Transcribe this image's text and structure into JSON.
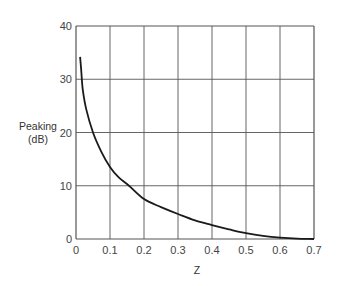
{
  "chart_data": {
    "type": "line",
    "title": "",
    "xlabel": "Z",
    "ylabel": "Peaking (dB)",
    "ylabel_lines": [
      "Peaking",
      "(dB)"
    ],
    "xlim": [
      0,
      0.7
    ],
    "ylim": [
      0,
      40
    ],
    "xticks": [
      "0",
      "0.1",
      "0.2",
      "0.3",
      "0.4",
      "0.5",
      "0.6",
      "0.7"
    ],
    "yticks": [
      "0",
      "10",
      "20",
      "30",
      "40"
    ],
    "grid": true,
    "legend": null,
    "series": [
      {
        "name": "Peaking",
        "x": [
          0.012,
          0.015,
          0.02,
          0.03,
          0.05,
          0.075,
          0.1,
          0.125,
          0.156,
          0.2,
          0.25,
          0.3,
          0.35,
          0.4,
          0.45,
          0.5,
          0.55,
          0.6,
          0.65,
          0.7
        ],
        "values": [
          34.2,
          32.0,
          28.0,
          24.4,
          20.0,
          16.3,
          13.5,
          11.6,
          10.0,
          7.5,
          6.0,
          4.7,
          3.5,
          2.6,
          1.8,
          1.1,
          0.6,
          0.25,
          0.07,
          0.0
        ]
      }
    ],
    "color": "#1a1a1a"
  }
}
